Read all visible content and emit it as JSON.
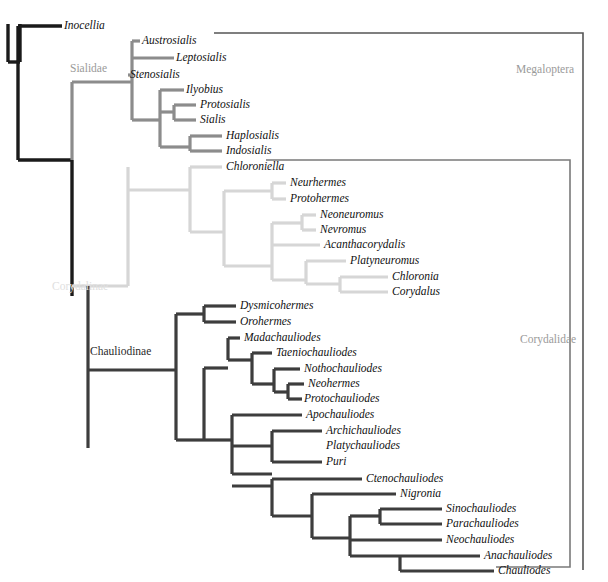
{
  "figure": {
    "type": "phylogenetic-cladogram",
    "title": "",
    "width": 608,
    "height": 582,
    "background": "#ffffff"
  },
  "colors": {
    "outgroup_black": "#1a1a1a",
    "sialidae_gray": "#8c8c8c",
    "corydalinae_light": "#d6d6d6",
    "chauliodinae_dark": "#3d3d3d",
    "bracket_gray": "#7a7a7a",
    "bracket_dark": "#555555",
    "label_gray": "#9a9a9a",
    "label_light": "#e0e0e0",
    "label_dark": "#2a2a2a",
    "taxon_text": "#111111"
  },
  "clade_labels": [
    {
      "name": "sialidae",
      "text": "Sialidae",
      "x": 70,
      "y": 69,
      "color": "#9a9a9a"
    },
    {
      "name": "corydalinae",
      "text": "Corydalinae",
      "x": 52,
      "y": 287,
      "color": "#e0e0e0"
    },
    {
      "name": "chauliodinae",
      "text": "Chauliodinae",
      "x": 90,
      "y": 352,
      "color": "#2a2a2a"
    },
    {
      "name": "megaloptera",
      "text": "Megaloptera",
      "x": 516,
      "y": 70,
      "color": "#9a9a9a"
    },
    {
      "name": "corydalidae",
      "text": "Corydalidae",
      "x": 520,
      "y": 340,
      "color": "#9a9a9a"
    }
  ],
  "taxa": [
    {
      "name": "inocellia",
      "text": "Inocellia",
      "x": 64,
      "y": 26,
      "group": "outgroup"
    },
    {
      "name": "austrosialis",
      "text": "Austrosialis",
      "x": 142,
      "y": 41,
      "group": "sialidae"
    },
    {
      "name": "leptosialis",
      "text": "Leptosialis",
      "x": 176,
      "y": 58,
      "group": "sialidae"
    },
    {
      "name": "stenosialis",
      "text": "Stenosialis",
      "x": 130,
      "y": 75,
      "group": "sialidae"
    },
    {
      "name": "ilyobius",
      "text": "Ilyobius",
      "x": 186,
      "y": 90,
      "group": "sialidae"
    },
    {
      "name": "protosialis",
      "text": "Protosialis",
      "x": 200,
      "y": 105,
      "group": "sialidae"
    },
    {
      "name": "sialis",
      "text": "Sialis",
      "x": 200,
      "y": 120,
      "group": "sialidae"
    },
    {
      "name": "haplosialis",
      "text": "Haplosialis",
      "x": 226,
      "y": 136,
      "group": "sialidae"
    },
    {
      "name": "indosialis",
      "text": "Indosialis",
      "x": 226,
      "y": 151,
      "group": "sialidae"
    },
    {
      "name": "chloroniella",
      "text": "Chloroniella",
      "x": 226,
      "y": 167,
      "group": "corydalinae"
    },
    {
      "name": "neurhermes",
      "text": "Neurhermes",
      "x": 290,
      "y": 183,
      "group": "corydalinae"
    },
    {
      "name": "protohermes",
      "text": "Protohermes",
      "x": 290,
      "y": 199,
      "group": "corydalinae"
    },
    {
      "name": "neoneuromus",
      "text": "Neoneuromus",
      "x": 320,
      "y": 215,
      "group": "corydalinae"
    },
    {
      "name": "nevromus",
      "text": "Nevromus",
      "x": 320,
      "y": 230,
      "group": "corydalinae"
    },
    {
      "name": "acanthacorydalis",
      "text": "Acanthacorydalis",
      "x": 324,
      "y": 245,
      "group": "corydalinae"
    },
    {
      "name": "platyneuromus",
      "text": "Platyneuromus",
      "x": 350,
      "y": 261,
      "group": "corydalinae"
    },
    {
      "name": "chloronia",
      "text": "Chloronia",
      "x": 392,
      "y": 277,
      "group": "corydalinae"
    },
    {
      "name": "corydalus",
      "text": "Corydalus",
      "x": 392,
      "y": 292,
      "group": "corydalinae"
    },
    {
      "name": "dysmicohermes",
      "text": "Dysmicohermes",
      "x": 240,
      "y": 306,
      "group": "chauliodinae"
    },
    {
      "name": "orohermes",
      "text": "Orohermes",
      "x": 240,
      "y": 322,
      "group": "chauliodinae"
    },
    {
      "name": "madachauliodes",
      "text": "Madachauliodes",
      "x": 244,
      "y": 338,
      "group": "chauliodinae"
    },
    {
      "name": "taeniochauliodes",
      "text": "Taeniochauliodes",
      "x": 276,
      "y": 353,
      "group": "chauliodinae"
    },
    {
      "name": "nothochauliodes",
      "text": "Nothochauliodes",
      "x": 304,
      "y": 369,
      "group": "chauliodinae"
    },
    {
      "name": "neohermes",
      "text": "Neohermes",
      "x": 308,
      "y": 384,
      "group": "chauliodinae"
    },
    {
      "name": "protochauliodes",
      "text": "Protochauliodes",
      "x": 304,
      "y": 399,
      "group": "chauliodinae"
    },
    {
      "name": "apochauliodes",
      "text": "Apochauliodes",
      "x": 306,
      "y": 415,
      "group": "chauliodinae"
    },
    {
      "name": "archichauliodes",
      "text": "Archichauliodes",
      "x": 326,
      "y": 431,
      "group": "chauliodinae"
    },
    {
      "name": "platychauliodes",
      "text": "Platychauliodes",
      "x": 326,
      "y": 446,
      "group": "chauliodinae"
    },
    {
      "name": "puri",
      "text": "Puri",
      "x": 326,
      "y": 462,
      "group": "chauliodinae"
    },
    {
      "name": "ctenochauliodes",
      "text": "Ctenochauliodes",
      "x": 366,
      "y": 479,
      "group": "chauliodinae"
    },
    {
      "name": "nigronia",
      "text": "Nigronia",
      "x": 400,
      "y": 494,
      "group": "chauliodinae"
    },
    {
      "name": "sinochauliodes",
      "text": "Sinochauliodes",
      "x": 446,
      "y": 509,
      "group": "chauliodinae"
    },
    {
      "name": "parachauliodes",
      "text": "Parachauliodes",
      "x": 446,
      "y": 524,
      "group": "chauliodinae"
    },
    {
      "name": "neochauliodes",
      "text": "Neochauliodes",
      "x": 446,
      "y": 540,
      "group": "chauliodinae"
    },
    {
      "name": "anachauliodes",
      "text": "Anachauliodes",
      "x": 484,
      "y": 556,
      "group": "chauliodinae"
    },
    {
      "name": "chauliodes",
      "text": "Chauliodes",
      "x": 498,
      "y": 571,
      "group": "chauliodinae"
    }
  ],
  "branches": {
    "outgroup": {
      "color": "#1a1a1a",
      "width": 3.4,
      "paths": [
        "M 8 24 L 8 62",
        "M 8 62 L 20 62",
        "M 20 24 L 20 62",
        "M 20 24 L 20 24",
        "M 18 26 L 62 26",
        "M 18 26 L 18 62",
        "M 8 62 L 8 62",
        "M 18 62 L 18 160",
        "M 18 160 L 72 160",
        "M 72 160 L 72 296",
        "M 18 96 L 18 96"
      ]
    },
    "sialidae": {
      "color": "#8c8c8c",
      "width": 3.2,
      "paths": [
        "M 72 82 L 72 160",
        "M 72 82 L 132 82",
        "M 132 41 L 132 120",
        "M 132 41 L 140 41",
        "M 132 58 L 174 58",
        "M 132 75 L 128 75",
        "M 132 120 L 160 120",
        "M 160 90 L 160 147",
        "M 160 90 L 184 90",
        "M 160 112 L 174 112",
        "M 174 105 L 174 120",
        "M 174 105 L 196 105",
        "M 174 120 L 196 120",
        "M 160 147 L 190 147",
        "M 190 136 L 190 151",
        "M 190 136 L 222 136",
        "M 190 151 L 222 151"
      ]
    },
    "corydalinae": {
      "color": "#d6d6d6",
      "width": 3.2,
      "paths": [
        "M 128 167 L 128 286",
        "M 128 286 L 72 286",
        "M 128 167 L 128 167",
        "M 128 183 L 128 183",
        "M 128 190 L 190 190",
        "M 190 167 L 190 232",
        "M 190 167 L 222 167",
        "M 190 232 L 224 232",
        "M 224 191 L 224 266",
        "M 224 191 L 272 191",
        "M 272 183 L 272 199",
        "M 272 183 L 286 183",
        "M 272 199 L 286 199",
        "M 224 266 L 272 266",
        "M 272 223 L 272 280",
        "M 272 223 L 302 223",
        "M 302 215 L 302 230",
        "M 302 215 L 316 215",
        "M 302 230 L 316 230",
        "M 272 245 L 320 245",
        "M 272 280 L 306 280",
        "M 306 261 L 306 284",
        "M 306 261 L 346 261",
        "M 306 284 L 340 284",
        "M 340 277 L 340 292",
        "M 340 277 L 388 277",
        "M 340 292 L 388 292"
      ]
    },
    "chauliodinae": {
      "color": "#3d3d3d",
      "width": 3.2,
      "paths": [
        "M 88 286 L 88 448",
        "M 176 314 L 176 440",
        "M 88 370 L 176 370",
        "M 176 314 L 204 314",
        "M 204 306 L 204 322",
        "M 204 306 L 236 306",
        "M 204 322 L 236 322",
        "M 176 440 L 204 440",
        "M 204 368 L 204 440",
        "M 204 368 L 228 368",
        "M 228 338 L 228 360",
        "M 228 338 L 240 338",
        "M 228 360 L 252 360",
        "M 252 353 L 252 384",
        "M 252 353 L 272 353",
        "M 252 384 L 274 384",
        "M 274 369 L 274 392",
        "M 274 369 L 300 369",
        "M 274 392 L 288 392",
        "M 288 384 L 288 399",
        "M 288 384 L 304 384",
        "M 288 399 L 302 399",
        "M 204 440 L 232 440",
        "M 232 415 L 232 474",
        "M 232 415 L 302 415",
        "M 232 446 L 272 446",
        "M 272 431 L 272 462",
        "M 272 431 L 322 431",
        "M 272 446 L 272 446",
        "M 272 462 L 322 462",
        "M 232 474 L 272 474",
        "M 272 474 L 272 474",
        "M 260 474 L 260 474",
        "M 232 474 L 232 474",
        "M 236 487 L 236 487",
        "M 232 486 L 272 486",
        "M 272 479 L 272 516",
        "M 272 479 L 362 479",
        "M 272 516 L 312 516",
        "M 312 494 L 312 538",
        "M 312 494 L 396 494",
        "M 312 538 L 350 538",
        "M 350 516 L 350 556",
        "M 350 516 L 380 516",
        "M 380 509 L 380 524",
        "M 380 509 L 442 509",
        "M 380 524 L 442 524",
        "M 350 540 L 442 540",
        "M 350 556 L 400 556",
        "M 400 556 L 400 571",
        "M 400 556 L 480 556",
        "M 400 571 L 494 571"
      ]
    }
  },
  "brackets": [
    {
      "name": "megaloptera-bracket",
      "label": "Megaloptera",
      "color": "#555555",
      "width": 1.6,
      "path": "M 214 33 L 583 33 L 583 570"
    },
    {
      "name": "corydalidae-bracket",
      "label": "Corydalidae",
      "color": "#7a7a7a",
      "width": 1.6,
      "path": "M 266 160 L 570 160 L 570 567 L 496 567"
    }
  ]
}
